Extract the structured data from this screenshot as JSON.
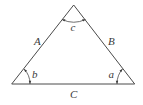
{
  "diagram": {
    "type": "triangle",
    "vertices": {
      "apex": [
        73.7,
        5
      ],
      "bottom_left": [
        11.7,
        84
      ],
      "bottom_right": [
        134.7,
        84
      ]
    },
    "sides": [
      {
        "id": "A",
        "label": "A",
        "between": [
          "bottom_left",
          "apex"
        ]
      },
      {
        "id": "B",
        "label": "B",
        "between": [
          "apex",
          "bottom_right"
        ]
      },
      {
        "id": "C",
        "label": "C",
        "between": [
          "bottom_left",
          "bottom_right"
        ]
      }
    ],
    "angles": [
      {
        "id": "c",
        "label": "c",
        "vertex": "apex"
      },
      {
        "id": "b",
        "label": "b",
        "vertex": "bottom_left"
      },
      {
        "id": "a",
        "label": "a",
        "vertex": "bottom_right"
      }
    ],
    "colors": {
      "line": "#4a4a4a",
      "text": "#3a3a3a",
      "background": "#ffffff"
    }
  }
}
